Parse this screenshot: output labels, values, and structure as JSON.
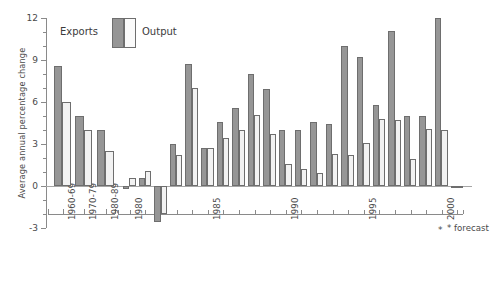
{
  "chart_data": {
    "type": "bar",
    "title": "",
    "subtitle": "",
    "xlabel": "",
    "ylabel": "Average annual percentage change",
    "ylim": [
      -3,
      12
    ],
    "ytick_values": [
      12,
      9,
      6,
      3,
      0,
      -3
    ],
    "ytick_labels": [
      "12",
      "9",
      "6",
      "3",
      "0",
      "-3"
    ],
    "grid": false,
    "legend_position": "top-left",
    "legend": [
      {
        "name": "Exports",
        "color": "#969696"
      },
      {
        "name": "Output",
        "color": "#f2f2f2"
      }
    ],
    "annotations": [
      {
        "text": "* forecast",
        "marker": "*"
      },
      {
        "text": "*",
        "target": "2001"
      }
    ],
    "panels": [
      {
        "name": "decades",
        "categories": [
          "1960-69",
          "1970-79",
          "1980-89"
        ],
        "tick_labels": [
          "1960-69",
          "1970-79",
          "1980-89"
        ],
        "series": [
          {
            "name": "Exports",
            "values": [
              8.6,
              5.0,
              4.0
            ]
          },
          {
            "name": "Output",
            "values": [
              6.0,
              4.0,
              2.5
            ]
          }
        ]
      },
      {
        "name": "years",
        "categories": [
          "1980",
          "1981",
          "1982",
          "1983",
          "1984",
          "1985",
          "1986",
          "1987",
          "1988",
          "1989",
          "1990",
          "1991",
          "1992",
          "1993",
          "1994",
          "1995",
          "1996",
          "1997",
          "1998",
          "1999",
          "2000",
          "2001"
        ],
        "tick_labels": [
          "1980",
          "1985",
          "1990",
          "1995",
          "2000"
        ],
        "series": [
          {
            "name": "Exports",
            "values": [
              -0.2,
              0.6,
              -2.6,
              3.0,
              8.7,
              2.7,
              4.6,
              5.6,
              8.0,
              6.9,
              4.0,
              4.0,
              4.6,
              4.4,
              10.0,
              9.2,
              5.8,
              11.1,
              5.0,
              5.0,
              12.0,
              -0.1
            ]
          },
          {
            "name": "Output",
            "values": [
              0.6,
              1.1,
              -2.0,
              2.2,
              7.0,
              2.7,
              3.4,
              4.0,
              5.1,
              3.7,
              1.6,
              1.2,
              0.9,
              2.3,
              2.2,
              3.1,
              4.8,
              4.7,
              1.9,
              4.1,
              4.0,
              -0.1
            ]
          }
        ]
      }
    ]
  }
}
